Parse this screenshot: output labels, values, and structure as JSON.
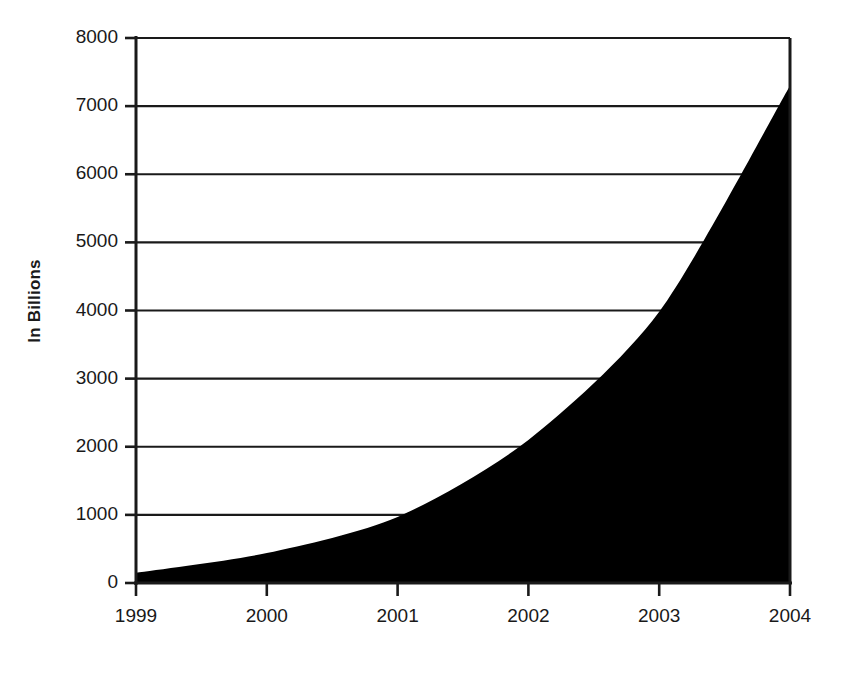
{
  "chart_data": {
    "type": "area",
    "title": "",
    "subtitle": "",
    "xlabel": "",
    "ylabel": "In Billions",
    "categories": [
      "1999",
      "2000",
      "2001",
      "2002",
      "2003",
      "2004"
    ],
    "x": [
      1999,
      2000,
      2001,
      2002,
      2003,
      2004
    ],
    "values": [
      150,
      440,
      970,
      2100,
      3980,
      7300
    ],
    "series": [
      {
        "name": "In Billions",
        "values": [
          150,
          440,
          970,
          2100,
          3980,
          7300
        ]
      }
    ],
    "ylim": [
      0,
      8000
    ],
    "xlim": [
      1999,
      2004
    ],
    "ytick_labels": [
      "0",
      "1000",
      "2000",
      "3000",
      "4000",
      "5000",
      "6000",
      "7000",
      "8000"
    ],
    "ytick_values": [
      0,
      1000,
      2000,
      3000,
      4000,
      5000,
      6000,
      7000,
      8000
    ],
    "xtick_labels": [
      "1999",
      "2000",
      "2001",
      "2002",
      "2003",
      "2004"
    ],
    "grid": "horizontal",
    "legend": "none",
    "fill_color": "#000000",
    "axis_color": "#1a1a1a",
    "background_color": "#ffffff"
  },
  "axes": {
    "y_label": "In Billions",
    "y_ticks": [
      {
        "label": "8000",
        "value": 8000
      },
      {
        "label": "7000",
        "value": 7000
      },
      {
        "label": "6000",
        "value": 6000
      },
      {
        "label": "5000",
        "value": 5000
      },
      {
        "label": "4000",
        "value": 4000
      },
      {
        "label": "3000",
        "value": 3000
      },
      {
        "label": "2000",
        "value": 2000
      },
      {
        "label": "1000",
        "value": 1000
      },
      {
        "label": "0",
        "value": 0
      }
    ],
    "x_ticks": [
      {
        "label": "1999",
        "value": 1999
      },
      {
        "label": "2000",
        "value": 2000
      },
      {
        "label": "2001",
        "value": 2001
      },
      {
        "label": "2002",
        "value": 2002
      },
      {
        "label": "2003",
        "value": 2003
      },
      {
        "label": "2004",
        "value": 2004
      }
    ]
  }
}
